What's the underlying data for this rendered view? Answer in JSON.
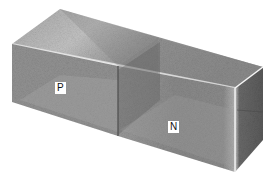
{
  "diagram": {
    "regions": [
      {
        "id": "p",
        "label": "P"
      },
      {
        "id": "n",
        "label": "N"
      }
    ],
    "colors": {
      "top_light": "#d9d9d9",
      "top_dark": "#8a8a8a",
      "front": "#8f8f8f",
      "front_dark": "#6e6e6e",
      "side": "#5e5e5e",
      "edge_highlight": "#f2f2f2"
    }
  }
}
